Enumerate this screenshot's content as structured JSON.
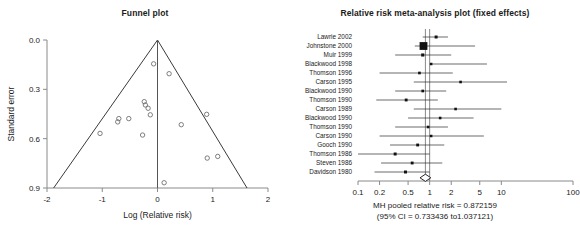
{
  "funnel": {
    "title": "Funnel plot",
    "chart_data": {
      "type": "scatter",
      "title": "Funnel plot",
      "xlabel": "Log (Relative risk)",
      "ylabel": "Standard error",
      "xlim": [
        -2,
        2
      ],
      "ylim": [
        0.9,
        0.0
      ],
      "y_inverted": true,
      "grid": false,
      "xticks": [
        -2,
        -1,
        0,
        1,
        2
      ],
      "xticklabels": [
        "-2",
        "-1",
        "0",
        "1",
        "2"
      ],
      "yticks": [
        0.0,
        0.3,
        0.6,
        0.9
      ],
      "yticklabels": [
        "0.0",
        "0.3",
        "0.6",
        "0.9"
      ],
      "center_x": 0.0,
      "funnel_apex": [
        0.0,
        0.0
      ],
      "funnel_left_base": [
        -1.88,
        0.9
      ],
      "funnel_right_base": [
        1.62,
        0.9
      ],
      "points": [
        {
          "x": -0.07,
          "y": 0.145
        },
        {
          "x": 0.21,
          "y": 0.205
        },
        {
          "x": -0.24,
          "y": 0.375
        },
        {
          "x": -0.22,
          "y": 0.395
        },
        {
          "x": -0.17,
          "y": 0.415
        },
        {
          "x": -0.13,
          "y": 0.455
        },
        {
          "x": 0.89,
          "y": 0.452
        },
        {
          "x": -0.7,
          "y": 0.478
        },
        {
          "x": -0.72,
          "y": 0.498
        },
        {
          "x": -0.52,
          "y": 0.478
        },
        {
          "x": 0.43,
          "y": 0.515
        },
        {
          "x": -1.04,
          "y": 0.568
        },
        {
          "x": -0.27,
          "y": 0.578
        },
        {
          "x": 0.9,
          "y": 0.718
        },
        {
          "x": 1.09,
          "y": 0.708
        },
        {
          "x": 0.12,
          "y": 0.868
        }
      ]
    }
  },
  "forest": {
    "title": "Relative risk meta-analysis plot (fixed effects)",
    "footer_line1": "MH pooled relative risk = 0.872159",
    "footer_line2": "(95% CI = 0.733436 to1.037121)",
    "chart_data": {
      "type": "forest",
      "title": "Relative risk meta-analysis plot (fixed effects)",
      "xlabel": "",
      "ylabel": "",
      "scale": "log",
      "xlim": [
        0.1,
        100
      ],
      "xticks": [
        0.1,
        0.2,
        0.5,
        1,
        2,
        5,
        10,
        100
      ],
      "xticklabels": [
        "0.1",
        "0.2",
        "0.5",
        "1",
        "2",
        "5",
        "10",
        "100"
      ],
      "null_value": 1,
      "pooled": {
        "label": "MH pooled relative risk",
        "estimate": 0.872159,
        "ci_low": 0.733436,
        "ci_high": 1.037121
      },
      "studies": [
        {
          "label": "Lawrie 2002",
          "rr": 1.23,
          "ci_low": 0.8,
          "ci_high": 1.8,
          "weight": 0.22
        },
        {
          "label": "Johnstone 2000",
          "rr": 0.82,
          "ci_low": 0.62,
          "ci_high": 4.3,
          "weight": 1.0
        },
        {
          "label": "Muir 1999",
          "rr": 0.8,
          "ci_low": 0.33,
          "ci_high": 2.0,
          "weight": 0.24
        },
        {
          "label": "Blackwood 1998",
          "rr": 1.05,
          "ci_low": 1.0,
          "ci_high": 6.3,
          "weight": 0.14
        },
        {
          "label": "Thomson 1996",
          "rr": 0.72,
          "ci_low": 0.2,
          "ci_high": 2.1,
          "weight": 0.17
        },
        {
          "label": "Carson 1995",
          "rr": 2.7,
          "ci_low": 0.6,
          "ci_high": 12.0,
          "weight": 0.16
        },
        {
          "label": "Blackwood 1990",
          "rr": 0.8,
          "ci_low": 0.33,
          "ci_high": 1.7,
          "weight": 0.17
        },
        {
          "label": "Thomson 1990",
          "rr": 0.47,
          "ci_low": 0.18,
          "ci_high": 1.3,
          "weight": 0.2
        },
        {
          "label": "Carson 1989",
          "rr": 2.3,
          "ci_low": 0.6,
          "ci_high": 10.0,
          "weight": 0.16
        },
        {
          "label": "Blackwood 1990",
          "rr": 1.4,
          "ci_low": 0.5,
          "ci_high": 4.1,
          "weight": 0.16
        },
        {
          "label": "Thomson 1990",
          "rr": 0.95,
          "ci_low": 0.33,
          "ci_high": 1.8,
          "weight": 0.16
        },
        {
          "label": "Carson 1990",
          "rr": 1.05,
          "ci_low": 0.2,
          "ci_high": 5.7,
          "weight": 0.14
        },
        {
          "label": "Gooch 1990",
          "rr": 0.68,
          "ci_low": 0.28,
          "ci_high": 1.6,
          "weight": 0.2
        },
        {
          "label": "Thomson 1986",
          "rr": 0.33,
          "ci_low": 0.1,
          "ci_high": 1.0,
          "weight": 0.22
        },
        {
          "label": "Steven 1986",
          "rr": 0.57,
          "ci_low": 0.21,
          "ci_high": 1.5,
          "weight": 0.2
        },
        {
          "label": "Davidson 1980",
          "rr": 0.46,
          "ci_low": 0.17,
          "ci_high": 1.0,
          "weight": 0.22
        }
      ]
    }
  }
}
